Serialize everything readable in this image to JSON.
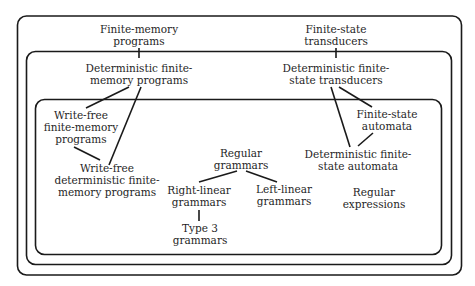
{
  "diagram": {
    "type": "nested-set-hierarchy",
    "colors": {
      "stroke": "#1a1a1a",
      "text": "#1f1f1f",
      "background": "#ffffff"
    },
    "regions": [
      {
        "id": "outer",
        "label": "outer region"
      },
      {
        "id": "middle",
        "label": "middle region"
      },
      {
        "id": "inner",
        "label": "inner region"
      }
    ],
    "nodes": {
      "finite_memory_programs": {
        "line1": "Finite-memory",
        "line2": "programs"
      },
      "finite_state_transducers": {
        "line1": "Finite-state",
        "line2": "transducers"
      },
      "det_finite_memory_programs": {
        "line1": "Deterministic finite-",
        "line2": "memory programs"
      },
      "det_finite_state_transducers": {
        "line1": "Deterministic finite-",
        "line2": "state transducers"
      },
      "write_free_fmp": {
        "line1": "Write-free",
        "line2": "finite-memory",
        "line3": "programs"
      },
      "write_free_det_fmp": {
        "line1": "Write-free",
        "line2": "deterministic finite-",
        "line3": "memory programs"
      },
      "finite_state_automata": {
        "line1": "Finite-state",
        "line2": "automata"
      },
      "det_finite_state_automata": {
        "line1": "Deterministic finite-",
        "line2": "state automata"
      },
      "regular_grammars": {
        "line1": "Regular",
        "line2": "grammars"
      },
      "right_linear_grammars": {
        "line1": "Right-linear",
        "line2": "grammars"
      },
      "left_linear_grammars": {
        "line1": "Left-linear",
        "line2": "grammars"
      },
      "type3_grammars": {
        "line1": "Type 3",
        "line2": "grammars"
      },
      "regular_expressions": {
        "line1": "Regular",
        "line2": "expressions"
      }
    },
    "edges": [
      [
        "finite_memory_programs",
        "det_finite_memory_programs"
      ],
      [
        "finite_state_transducers",
        "det_finite_state_transducers"
      ],
      [
        "det_finite_memory_programs",
        "write_free_fmp"
      ],
      [
        "det_finite_memory_programs",
        "write_free_det_fmp"
      ],
      [
        "write_free_fmp",
        "write_free_det_fmp"
      ],
      [
        "det_finite_state_transducers",
        "finite_state_automata"
      ],
      [
        "det_finite_state_transducers",
        "det_finite_state_automata"
      ],
      [
        "finite_state_automata",
        "det_finite_state_automata"
      ],
      [
        "regular_grammars",
        "right_linear_grammars"
      ],
      [
        "regular_grammars",
        "left_linear_grammars"
      ],
      [
        "right_linear_grammars",
        "type3_grammars"
      ]
    ]
  }
}
